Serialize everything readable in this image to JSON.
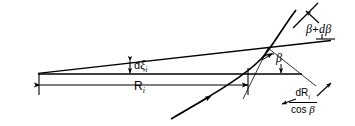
{
  "figure": {
    "type": "technical-line-diagram",
    "title": "",
    "background_color": "#ffffff",
    "line_color": "#000000",
    "width": 355,
    "height": 126,
    "labels": {
      "beta_plus_dbeta": {
        "text": "β + dβ",
        "symbol": "β",
        "operator": "+",
        "differential": "dβ"
      },
      "beta": {
        "text": "β"
      },
      "d_xi_i": {
        "prefix": "d",
        "symbol": "ξ",
        "subscript": "i",
        "text": "dξᵢ"
      },
      "R_i": {
        "symbol": "R",
        "subscript": "i",
        "text": "Rᵢ"
      },
      "dR_over_cos_beta": {
        "numerator_prefix": "d",
        "numerator_symbol": "R",
        "numerator_subscript": "i",
        "denominator": "cos",
        "denominator_symbol": "β",
        "text": "dRᵢ / cos β"
      }
    },
    "geometry": {
      "apex": {
        "x": 38,
        "y": 74
      },
      "baseline": {
        "x1": 38,
        "y1": 74,
        "x2": 302,
        "y2": 74
      },
      "tangent_line": {
        "x1": 38,
        "y1": 73,
        "x2": 330,
        "y2": 41
      },
      "intersection": {
        "x": 268,
        "y": 47
      },
      "curve_foot": {
        "x": 248,
        "y": 74
      },
      "dimension_R": {
        "x1": 40,
        "y1": 85,
        "x2": 248,
        "y2": 85
      }
    }
  }
}
